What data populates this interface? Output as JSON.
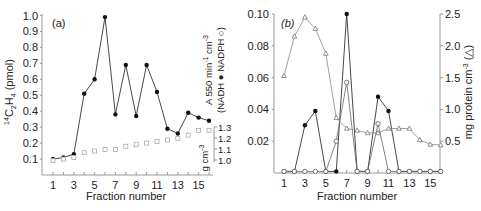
{
  "chart_data": [
    {
      "panel": "a",
      "type": "line",
      "panel_label": "(a)",
      "xlabel": "Fraction number",
      "ylabel": "14C2H4 (pmol)",
      "ylabel_right": "A 550 min-1 cm-3 (NADH ● NADPH ○)",
      "ylabel_right2": "g cm-3",
      "x": [
        1,
        2,
        3,
        4,
        5,
        6,
        7,
        8,
        9,
        10,
        11,
        12,
        13,
        14,
        15,
        16
      ],
      "xticks": [
        1,
        3,
        5,
        7,
        9,
        11,
        13,
        15
      ],
      "yticks": [
        0.1,
        0.2,
        0.3,
        0.4,
        0.5,
        0.6,
        0.7,
        0.8,
        0.9,
        1.0
      ],
      "ylim": [
        0,
        1.0
      ],
      "density_ticks": [
        1.0,
        1.1,
        1.2,
        1.3
      ],
      "series": [
        {
          "name": "14C2H4 (filled circles)",
          "marker": "filled-circle",
          "values": [
            0.1,
            0.11,
            0.13,
            0.51,
            0.6,
            0.99,
            0.38,
            0.69,
            0.37,
            0.69,
            0.52,
            0.29,
            0.26,
            0.39,
            0.36,
            0.34
          ]
        },
        {
          "name": "Density (open squares)",
          "marker": "open-square",
          "values": [
            0.09,
            0.1,
            0.11,
            0.14,
            0.15,
            0.16,
            0.16,
            0.18,
            0.19,
            0.2,
            0.21,
            0.22,
            0.23,
            0.25,
            0.28,
            0.28
          ]
        }
      ]
    },
    {
      "panel": "b",
      "type": "line",
      "panel_label": "(b)",
      "xlabel": "Fraction number",
      "ylabel": "",
      "ylabel_right": "mg protein cm-3 (△)",
      "x": [
        1,
        2,
        3,
        4,
        5,
        6,
        7,
        8,
        9,
        10,
        11,
        12,
        13,
        14,
        15,
        16
      ],
      "xticks": [
        1,
        3,
        5,
        7,
        9,
        11,
        13,
        15
      ],
      "yticks": [
        0.02,
        0.04,
        0.06,
        0.08,
        0.1
      ],
      "ylim": [
        0,
        0.1
      ],
      "yticks_right": [
        0.5,
        1.0,
        1.5,
        2.0,
        2.5
      ],
      "ylim_right": [
        0,
        2.5
      ],
      "series": [
        {
          "name": "NADH (filled circles)",
          "marker": "filled-circle",
          "values": [
            0.001,
            0.001,
            0.03,
            0.039,
            0.001,
            0.001,
            0.1,
            0.001,
            0.001,
            0.048,
            0.039,
            0.001,
            0.001,
            0.001,
            0.001,
            0.001
          ]
        },
        {
          "name": "NADPH (open circles)",
          "marker": "open-circle",
          "values": [
            0.001,
            0.001,
            0.001,
            0.001,
            0.001,
            0.02,
            0.057,
            0.001,
            0.001,
            0.031,
            0.001,
            0.001,
            0.001,
            0.001,
            0.001,
            0.001
          ]
        },
        {
          "name": "Protein (open triangles)",
          "marker": "open-triangle",
          "axis": "right",
          "values": [
            1.53,
            2.15,
            2.45,
            2.27,
            1.88,
            0.87,
            0.7,
            0.67,
            0.63,
            0.63,
            0.7,
            0.7,
            0.7,
            0.52,
            0.45,
            0.44
          ]
        }
      ]
    }
  ]
}
